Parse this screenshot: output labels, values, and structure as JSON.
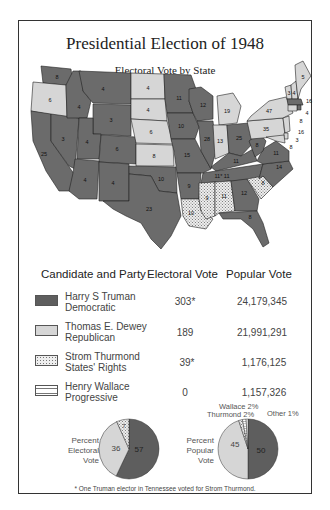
{
  "title": "Presidential Election of 1948",
  "subtitle": "Electoral Vote by State",
  "colors": {
    "truman": "#6b6b6b",
    "dewey": "#d6d6d6",
    "thurmond": "#e6e6e6",
    "wallace": "#ffffff",
    "border": "#222222"
  },
  "legend": {
    "headers": {
      "candidate": "Candidate and Party",
      "electoral": "Electoral Vote",
      "popular": "Popular Vote"
    },
    "rows": [
      {
        "name": "Harry S Truman",
        "party": "Democratic",
        "electoral": "303*",
        "popular": "24,179,345",
        "pattern": "solid-dark"
      },
      {
        "name": "Thomas E. Dewey",
        "party": "Republican",
        "electoral": "189",
        "popular": "21,991,291",
        "pattern": "solid-light"
      },
      {
        "name": "Strom Thurmond",
        "party": "States' Rights",
        "electoral": "39*",
        "popular": "1,176,125",
        "pattern": "dotted"
      },
      {
        "name": "Henry Wallace",
        "party": "Progressive",
        "electoral": "0",
        "popular": "1,157,326",
        "pattern": "horizontal-stripes"
      }
    ]
  },
  "pies": {
    "electoral": {
      "label_lines": [
        "Percent",
        "Electoral",
        "Vote"
      ],
      "slices": [
        {
          "name": "Truman",
          "value": 57,
          "label": "57"
        },
        {
          "name": "Dewey",
          "value": 36,
          "label": "36"
        },
        {
          "name": "Thurmond",
          "value": 7,
          "label": "7"
        }
      ]
    },
    "popular": {
      "label_lines": [
        "Percent",
        "Popular",
        "Vote"
      ],
      "slices": [
        {
          "name": "Truman",
          "value": 50,
          "label": "50"
        },
        {
          "name": "Dewey",
          "value": 45,
          "label": "45"
        },
        {
          "name": "Thurmond",
          "value": 2,
          "label": "Thurmond 2%"
        },
        {
          "name": "Wallace",
          "value": 2,
          "label": "Wallace 2%"
        },
        {
          "name": "Other",
          "value": 1,
          "label": "Other 1%"
        }
      ]
    }
  },
  "footnote": "* One Truman elector in Tennessee voted for Strom Thurmond.",
  "state_votes": {
    "WA": "8",
    "OR": "6",
    "CA": "25",
    "NV": "3",
    "ID": "4",
    "MT": "4",
    "WY": "3",
    "UT": "4",
    "CO": "6",
    "AZ": "4",
    "NM": "4",
    "ND": "4",
    "SD": "4",
    "NE": "6",
    "KS": "8",
    "OK": "10",
    "TX": "23",
    "MN": "11",
    "IA": "10",
    "MO": "15",
    "AR": "9",
    "LA": "10",
    "WI": "12",
    "IL": "28",
    "MI": "19",
    "IN": "13",
    "OH": "25",
    "KY": "11",
    "TN": "11* 11",
    "MS": "9",
    "AL": "11",
    "GA": "12",
    "FL": "8",
    "SC": "8",
    "NC": "14",
    "VA": "11",
    "WV": "8",
    "PA": "35",
    "NY": "47",
    "VT": "3",
    "NH": "4",
    "ME": "5",
    "MA": "16",
    "RI": "4",
    "CT": "8",
    "NJ": "16",
    "DE": "3",
    "MD": "8"
  }
}
